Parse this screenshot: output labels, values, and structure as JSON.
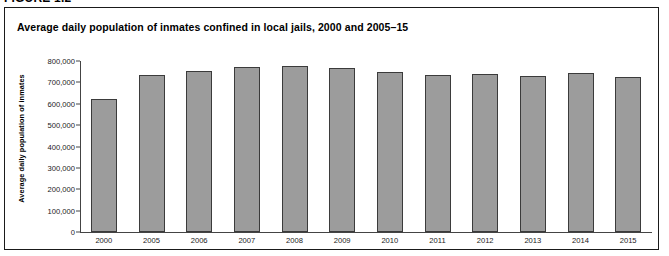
{
  "figure_label": "FIGURE 1.2",
  "chart_data": {
    "type": "bar",
    "title": "Average daily population of inmates confined in local jails, 2000 and 2005–15",
    "xlabel": "",
    "ylabel": "Average daily population of inmates",
    "categories": [
      "2000",
      "2005",
      "2006",
      "2007",
      "2008",
      "2009",
      "2010",
      "2011",
      "2012",
      "2013",
      "2014",
      "2015"
    ],
    "values": [
      621149,
      733442,
      755320,
      773138,
      776573,
      767620,
      748553,
      735601,
      737369,
      731208,
      744592,
      727400
    ],
    "ylim": [
      0,
      800000
    ],
    "ytick_labels": [
      "800,000",
      "700,000",
      "600,000",
      "500,000",
      "400,000",
      "300,000",
      "200,000",
      "100,000",
      "0"
    ],
    "ytick_values": [
      800000,
      700000,
      600000,
      500000,
      400000,
      300000,
      200000,
      100000,
      0
    ],
    "grid": false,
    "legend": "none",
    "bar_color": "#9c9c9c",
    "bar_border_color": "#3b3b3b",
    "axis_color": "#444444"
  }
}
